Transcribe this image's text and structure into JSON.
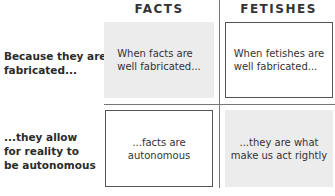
{
  "columns": [
    "FACTS",
    "FETISHES"
  ],
  "rows": [
    "Because they are fabricated...",
    "...they allow for reality to be autonomous"
  ],
  "row_labels": {
    "row1": [
      "Because they are",
      "fabricated..."
    ],
    "row2": [
      "...they allow",
      "for reality to",
      "be autonomous"
    ]
  },
  "cells": {
    "facts_row1": [
      "When facts are",
      "well fabricated..."
    ],
    "fetishes_row1": [
      "When fetishes are",
      "well fabricated..."
    ],
    "facts_row2": [
      "...facts are",
      "autonomous"
    ],
    "fetishes_row2": [
      "...they are what",
      "make us act rightly"
    ]
  }
}
